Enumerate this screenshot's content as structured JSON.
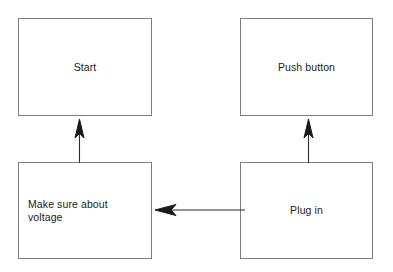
{
  "diagram": {
    "background_color": "#ffffff",
    "box_border_color": "#7d7d7d",
    "text_color": "#1a1a1a",
    "arrow_color": "#1a1a1a",
    "nodes": [
      {
        "id": "start",
        "label": "Start",
        "align": "center",
        "x": 18,
        "y": 18,
        "width": 134,
        "height": 98
      },
      {
        "id": "push-button",
        "label": "Push button",
        "align": "center",
        "x": 240,
        "y": 18,
        "width": 133,
        "height": 98
      },
      {
        "id": "make-sure-about-voltage",
        "label": "Make sure about\nvoltage",
        "align": "left",
        "x": 18,
        "y": 162,
        "width": 134,
        "height": 97
      },
      {
        "id": "plug-in",
        "label": "Plug in",
        "align": "center",
        "x": 240,
        "y": 162,
        "width": 133,
        "height": 97
      }
    ],
    "edges": [
      {
        "id": "voltage-to-start",
        "from": "make-sure-about-voltage",
        "to": "start",
        "direction": "up"
      },
      {
        "id": "plug-to-push-button",
        "from": "plug-in",
        "to": "push-button",
        "direction": "up"
      },
      {
        "id": "plug-to-voltage",
        "from": "plug-in",
        "to": "make-sure-about-voltage",
        "direction": "left"
      }
    ]
  }
}
